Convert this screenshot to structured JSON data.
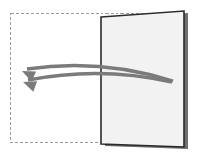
{
  "canvas": {
    "width": 200,
    "height": 155,
    "background_color": "#ffffff",
    "title": "Page turn / swipe gesture illustration"
  },
  "selection_frame": {
    "name": "dashed-bounding-box",
    "x": 10,
    "y": 13,
    "width": 170,
    "height": 130,
    "stroke_color": "#9a9a9a",
    "stroke_width": 1,
    "dash_pattern": "3 2",
    "fill": "none"
  },
  "page": {
    "name": "page-panel",
    "label": "Page",
    "fill_color": "#f2f2f2",
    "stroke_color": "#2b2b2b",
    "stroke_width": 1.6,
    "shadow_color": "#6f6f6f",
    "corners": {
      "top_left": [
        101,
        17
      ],
      "top_right": [
        184,
        11
      ],
      "bottom_right": [
        184,
        147
      ],
      "bottom_left": [
        101,
        144
      ]
    },
    "shadow_offset_x": 4,
    "shadow_offset_y": 2
  },
  "arrows": {
    "color": "#7b7b7b",
    "stroke_width": 3.4,
    "count": 2,
    "direction": "right-to-left",
    "items": [
      {
        "name": "swipe-arrow-upper",
        "start": [
          173,
          81
        ],
        "control": [
          100,
          58
        ],
        "end": [
          27,
          69
        ],
        "head_angle_deg": 205
      },
      {
        "name": "swipe-arrow-lower",
        "start": [
          172,
          82
        ],
        "control": [
          100,
          66
        ],
        "end": [
          28,
          80
        ],
        "head_angle_deg": 200
      }
    ]
  }
}
